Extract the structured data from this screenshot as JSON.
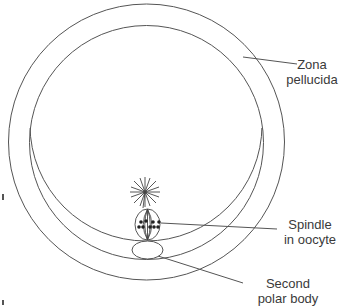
{
  "diagram": {
    "stroke_color": "#555555",
    "labels": {
      "zona": {
        "line1": "Zona",
        "line2": "pellucida"
      },
      "spindle": {
        "line1": "Spindle",
        "line2": "in oocyte"
      },
      "polar_body": {
        "line1": "Second",
        "line2": "polar body"
      }
    },
    "structures": [
      {
        "name": "zona-pellucida-outer",
        "shape": "circle",
        "cx": 146.5,
        "cy": 142,
        "r": 138
      },
      {
        "name": "zona-pellucida-inner",
        "shape": "circle",
        "cx": 146.5,
        "cy": 142.5,
        "r": 117
      },
      {
        "name": "oocyte-membrane",
        "shape": "arc",
        "cx": 146,
        "cy": 125,
        "r": 116
      },
      {
        "name": "aster",
        "shape": "star",
        "cx": 145,
        "cy": 192,
        "r": 15
      },
      {
        "name": "spindle",
        "shape": "ellipse",
        "cx": 147.5,
        "cy": 224.5,
        "rx": 12.5,
        "ry": 15.5
      },
      {
        "name": "second-polar-body",
        "shape": "ellipse",
        "cx": 147.5,
        "cy": 250,
        "rx": 15.5,
        "ry": 9
      }
    ]
  }
}
